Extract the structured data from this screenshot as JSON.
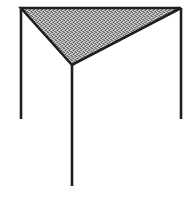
{
  "figure": {
    "title": "Three-legged stand with shaded triangular top",
    "caption": "",
    "background_color": "#ffffff",
    "canvas": {
      "width": 190,
      "height": 199
    },
    "line_color": "#1e1e1e",
    "fill_color": "#9a9a9a",
    "fill_pattern": "dithered-stipple-gray",
    "stroke_width": 2.6,
    "shapes": {
      "top_panel": {
        "name": "triangular-top-panel",
        "type": "polygon",
        "points": "21,8 181,8 72,65",
        "vertices": [
          {
            "label": "top-left-corner",
            "x": 21,
            "y": 8
          },
          {
            "label": "top-right-corner",
            "x": 181,
            "y": 8
          },
          {
            "label": "front-apex-corner",
            "x": 72,
            "y": 65
          }
        ]
      },
      "legs": [
        {
          "name": "left-leg",
          "x1": 21,
          "y1": 8,
          "x2": 21,
          "y2": 119
        },
        {
          "name": "right-leg",
          "x1": 181,
          "y1": 8,
          "x2": 181,
          "y2": 119
        },
        {
          "name": "center-front-leg",
          "x1": 72,
          "y1": 65,
          "x2": 72,
          "y2": 186
        }
      ]
    }
  }
}
